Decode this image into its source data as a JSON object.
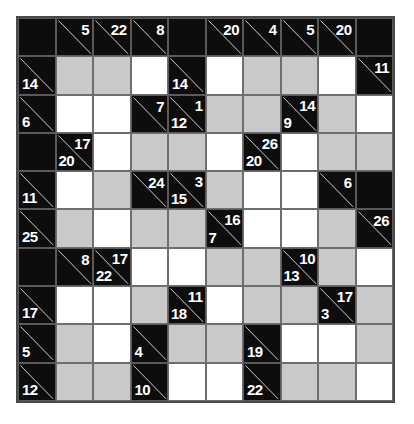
{
  "puzzle": {
    "name": "kakuro-grid",
    "rows": 10,
    "cols": 10,
    "colors": {
      "block": "#0d0d0d",
      "empty_white": "#ffffff",
      "empty_gray": "#c9c9c9",
      "clue_text": "#ffffff",
      "grid_line": "#6e6e6e",
      "border": "#4a4a4a",
      "page_background": "#ffffff"
    },
    "legend": {
      "block": "clue or filler block cell",
      "white": "empty answer cell (white)",
      "gray": "empty answer cell (shaded)"
    },
    "cells": [
      [
        {
          "type": "block"
        },
        {
          "type": "block",
          "down": "5"
        },
        {
          "type": "block",
          "down": "22"
        },
        {
          "type": "block",
          "down": "8"
        },
        {
          "type": "block"
        },
        {
          "type": "block",
          "down": "20"
        },
        {
          "type": "block",
          "down": "4"
        },
        {
          "type": "block",
          "down": "5"
        },
        {
          "type": "block",
          "down": "20"
        },
        {
          "type": "block"
        }
      ],
      [
        {
          "type": "block",
          "across": "14"
        },
        {
          "type": "gray"
        },
        {
          "type": "gray"
        },
        {
          "type": "white"
        },
        {
          "type": "block",
          "across": "14"
        },
        {
          "type": "white"
        },
        {
          "type": "gray"
        },
        {
          "type": "gray"
        },
        {
          "type": "white"
        },
        {
          "type": "block",
          "down": "11"
        }
      ],
      [
        {
          "type": "block",
          "across": "6"
        },
        {
          "type": "white"
        },
        {
          "type": "white"
        },
        {
          "type": "block",
          "down": "7"
        },
        {
          "type": "block",
          "across": "12",
          "down": "1"
        },
        {
          "type": "gray"
        },
        {
          "type": "gray"
        },
        {
          "type": "block",
          "across": "9",
          "down": "14"
        },
        {
          "type": "gray"
        },
        {
          "type": "white"
        }
      ],
      [
        {
          "type": "block"
        },
        {
          "type": "block",
          "across": "20",
          "down": "17"
        },
        {
          "type": "white"
        },
        {
          "type": "gray"
        },
        {
          "type": "gray"
        },
        {
          "type": "white"
        },
        {
          "type": "block",
          "across": "20",
          "down": "26"
        },
        {
          "type": "white"
        },
        {
          "type": "gray"
        },
        {
          "type": "gray"
        }
      ],
      [
        {
          "type": "block",
          "across": "11"
        },
        {
          "type": "white"
        },
        {
          "type": "gray"
        },
        {
          "type": "block",
          "down": "24"
        },
        {
          "type": "block",
          "across": "15",
          "down": "3"
        },
        {
          "type": "gray"
        },
        {
          "type": "white"
        },
        {
          "type": "white"
        },
        {
          "type": "block",
          "down": "6"
        },
        {
          "type": "block"
        }
      ],
      [
        {
          "type": "block",
          "across": "25"
        },
        {
          "type": "gray"
        },
        {
          "type": "white"
        },
        {
          "type": "gray"
        },
        {
          "type": "gray"
        },
        {
          "type": "block",
          "across": "7",
          "down": "16"
        },
        {
          "type": "white"
        },
        {
          "type": "white"
        },
        {
          "type": "gray"
        },
        {
          "type": "block",
          "down": "26"
        }
      ],
      [
        {
          "type": "block"
        },
        {
          "type": "block",
          "down": "8"
        },
        {
          "type": "block",
          "across": "22",
          "down": "17"
        },
        {
          "type": "white"
        },
        {
          "type": "white"
        },
        {
          "type": "gray"
        },
        {
          "type": "gray"
        },
        {
          "type": "block",
          "across": "13",
          "down": "10"
        },
        {
          "type": "gray"
        },
        {
          "type": "white"
        }
      ],
      [
        {
          "type": "block",
          "across": "17"
        },
        {
          "type": "white"
        },
        {
          "type": "white"
        },
        {
          "type": "gray"
        },
        {
          "type": "block",
          "across": "18",
          "down": "11"
        },
        {
          "type": "white"
        },
        {
          "type": "gray"
        },
        {
          "type": "gray"
        },
        {
          "type": "block",
          "across": "3",
          "down": "17"
        },
        {
          "type": "gray"
        }
      ],
      [
        {
          "type": "block",
          "across": "5"
        },
        {
          "type": "gray"
        },
        {
          "type": "white"
        },
        {
          "type": "block",
          "across": "4"
        },
        {
          "type": "gray"
        },
        {
          "type": "gray"
        },
        {
          "type": "block",
          "across": "19"
        },
        {
          "type": "white"
        },
        {
          "type": "white"
        },
        {
          "type": "gray"
        }
      ],
      [
        {
          "type": "block",
          "across": "12"
        },
        {
          "type": "gray"
        },
        {
          "type": "gray"
        },
        {
          "type": "block",
          "across": "10"
        },
        {
          "type": "white"
        },
        {
          "type": "white"
        },
        {
          "type": "block",
          "across": "22"
        },
        {
          "type": "gray"
        },
        {
          "type": "gray"
        },
        {
          "type": "white"
        }
      ]
    ]
  }
}
